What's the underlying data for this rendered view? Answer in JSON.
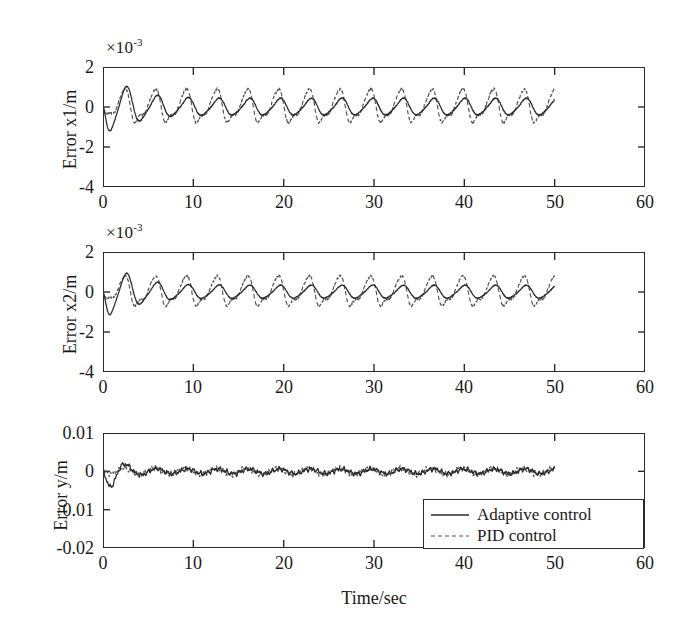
{
  "figure": {
    "xlabel": "Time/sec",
    "background": "#ffffff",
    "line_color": "#2b2b2b"
  },
  "legend": {
    "position": "bottom-right",
    "entries": [
      {
        "label": "Adaptive control",
        "style": "solid",
        "icon": "solid-line-icon"
      },
      {
        "label": "PID control",
        "style": "dashed",
        "icon": "dashed-line-icon"
      }
    ]
  },
  "chart_data": [
    {
      "type": "line",
      "id": "error-x1",
      "title": "",
      "ylabel": "Error x1/m",
      "xlabel": "",
      "y_exponent_label": "×10",
      "y_exponent_sup": "-3",
      "y_scale": 0.001,
      "xlim": [
        0,
        60
      ],
      "ylim": [
        -4,
        2
      ],
      "xticks": [
        0,
        10,
        20,
        30,
        40,
        50,
        60
      ],
      "xticklabels": [
        "0",
        "10",
        "20",
        "30",
        "40",
        "50",
        "60"
      ],
      "yticks": [
        2,
        0,
        -2,
        -4
      ],
      "yticklabels": [
        "2",
        "0",
        "-2",
        "-4"
      ],
      "grid": false,
      "data_extent_x": [
        0,
        50
      ],
      "series": [
        {
          "name": "Adaptive control",
          "style": "solid",
          "description": "Damped oscillation starting near 0, dipping to about -2.3e-3 near t=1.6, overshoot to +1.7e-3 near t=3.8, decaying oscillatory envelope settling to roughly +/-0.5e-3 by t=50",
          "envelope_start": 2.3,
          "envelope_end": 0.45,
          "period": 3.4,
          "first_trough": -2.3,
          "first_peak": 1.7
        },
        {
          "name": "PID control",
          "style": "dashed",
          "description": "Lower initial transient, settles into a near-constant amplitude oscillation of about +/-1.0e-3 with sharper peaks, persisting to t=50",
          "envelope_start": 1.0,
          "envelope_end": 0.95,
          "period": 3.4,
          "first_trough": -0.9,
          "first_peak": 1.1
        }
      ]
    },
    {
      "type": "line",
      "id": "error-x2",
      "title": "",
      "ylabel": "Error x2/m",
      "xlabel": "",
      "y_exponent_label": "×10",
      "y_exponent_sup": "-3",
      "y_scale": 0.001,
      "xlim": [
        0,
        60
      ],
      "ylim": [
        -4,
        2
      ],
      "xticks": [
        0,
        10,
        20,
        30,
        40,
        50,
        60
      ],
      "xticklabels": [
        "0",
        "10",
        "20",
        "30",
        "40",
        "50",
        "60"
      ],
      "yticks": [
        2,
        0,
        -2,
        -4
      ],
      "yticklabels": [
        "2",
        "0",
        "-2",
        "-4"
      ],
      "grid": false,
      "data_extent_x": [
        0,
        50
      ],
      "series": [
        {
          "name": "Adaptive control",
          "style": "solid",
          "description": "Similar to x1: dip to about -2.2e-3 near t=1.7, first peak +1.4e-3 near t=3.9, decaying oscillation settling near zero by t=50",
          "envelope_start": 2.2,
          "envelope_end": 0.35,
          "period": 3.4,
          "first_trough": -2.2,
          "first_peak": 1.4
        },
        {
          "name": "PID control",
          "style": "dashed",
          "description": "Small initial transient then sustained oscillation of about +/-0.9e-3 with sharp triangular peaks through t=50",
          "envelope_start": 0.9,
          "envelope_end": 0.85,
          "period": 3.4,
          "first_trough": -0.8,
          "first_peak": 1.0
        }
      ]
    },
    {
      "type": "line",
      "id": "error-y",
      "title": "",
      "ylabel": "Error y/m",
      "xlabel": "Time/sec",
      "y_exponent_label": "",
      "y_exponent_sup": "",
      "y_scale": 1,
      "xlim": [
        0,
        60
      ],
      "ylim": [
        -0.02,
        0.01
      ],
      "xticks": [
        0,
        10,
        20,
        30,
        40,
        50,
        60
      ],
      "xticklabels": [
        "0",
        "10",
        "20",
        "30",
        "40",
        "50",
        "60"
      ],
      "yticks": [
        0.01,
        0,
        -0.01,
        -0.02
      ],
      "yticklabels": [
        "0.01",
        "0",
        "-0.01",
        "-0.02"
      ],
      "grid": false,
      "data_extent_x": [
        0,
        50
      ],
      "series": [
        {
          "name": "Adaptive control",
          "style": "solid",
          "description": "Large initial dip to about -0.0098 near t=1.7, overshoot to +0.0068 near t=3.9, then rapid decay to a small ripple about 0 for the rest of the record",
          "envelope_start": 0.0098,
          "envelope_end": 0.0006,
          "period": 3.4,
          "first_trough": -0.0098,
          "first_peak": 0.0068
        },
        {
          "name": "PID control",
          "style": "dashed",
          "description": "Stays as a small high-frequency ripple of about +/-0.0008 around zero across the whole record",
          "envelope_start": 0.0009,
          "envelope_end": 0.0008,
          "period": 3.4,
          "first_trough": -0.0008,
          "first_peak": 0.0009
        }
      ]
    }
  ]
}
